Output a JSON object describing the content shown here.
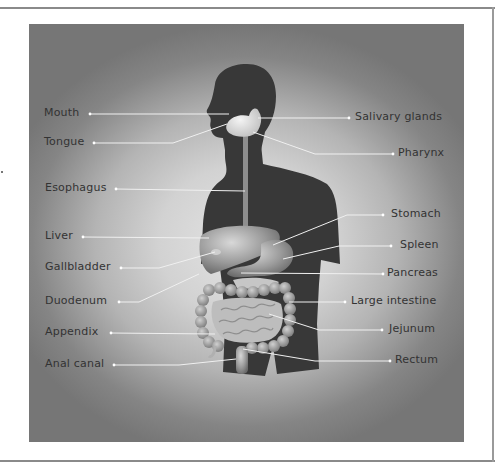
{
  "diagram": {
    "labels_left": [
      {
        "id": "mouth",
        "text": "Mouth"
      },
      {
        "id": "tongue",
        "text": "Tongue"
      },
      {
        "id": "esophagus",
        "text": "Esophagus"
      },
      {
        "id": "liver",
        "text": "Liver"
      },
      {
        "id": "gallbladder",
        "text": "Gallbladder"
      },
      {
        "id": "duodenum",
        "text": "Duodenum"
      },
      {
        "id": "appendix",
        "text": "Appendix"
      },
      {
        "id": "anal-canal",
        "text": "Anal canal"
      }
    ],
    "labels_right": [
      {
        "id": "salivary-glands",
        "text": "Salivary glands"
      },
      {
        "id": "pharynx",
        "text": "Pharynx"
      },
      {
        "id": "stomach",
        "text": "Stomach"
      },
      {
        "id": "spleen",
        "text": "Spleen"
      },
      {
        "id": "pancreas",
        "text": "Pancreas"
      },
      {
        "id": "large-intestine",
        "text": "Large intestine"
      },
      {
        "id": "jejunum",
        "text": "Jejunum"
      },
      {
        "id": "rectum",
        "text": "Rectum"
      }
    ],
    "colors": {
      "silhouette": "#3a3a3a",
      "organ": "#9c9c9c",
      "leader_line": "#f2f2f2",
      "label_text": "#333333"
    }
  }
}
